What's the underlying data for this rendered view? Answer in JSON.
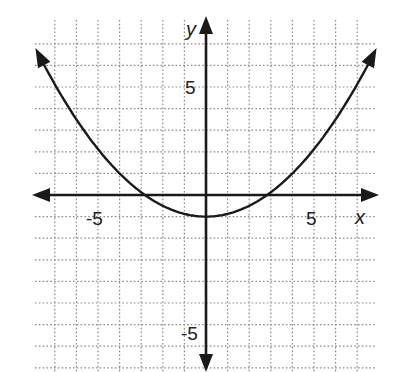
{
  "chart_data": {
    "type": "line",
    "title": "",
    "xlabel": "x",
    "ylabel": "y",
    "xlim": [
      -8,
      8
    ],
    "ylim": [
      -8,
      7
    ],
    "grid": true,
    "grid_style": "dotted",
    "x_tick_labels": [
      {
        "value": -5,
        "label": "-5"
      },
      {
        "value": 5,
        "label": "5"
      }
    ],
    "y_tick_labels": [
      {
        "value": 5,
        "label": "5"
      },
      {
        "value": -5,
        "label": "-5"
      }
    ],
    "series": [
      {
        "name": "parabola",
        "description": "upward-opening parabola with vertex (0, -1), x-intercepts near ±2.8, arrows at both ends",
        "equation_estimate": "y = x^2/8 - 1",
        "vertex": [
          0,
          -1
        ],
        "x": [
          -7.9,
          -7,
          -6,
          -5,
          -4,
          -3,
          -2,
          -1,
          0,
          1,
          2,
          3,
          4,
          5,
          6,
          7,
          7.9
        ],
        "y": [
          6.8,
          5.125,
          3.5,
          2.125,
          1,
          0.125,
          -0.5,
          -0.875,
          -1,
          -0.875,
          -0.5,
          0.125,
          1,
          2.125,
          3.5,
          5.125,
          6.8
        ]
      }
    ]
  },
  "labels": {
    "x_axis": "x",
    "y_axis": "y",
    "x_neg5": "-5",
    "x_pos5": "5",
    "y_pos5": "5",
    "y_neg5": "-5"
  }
}
